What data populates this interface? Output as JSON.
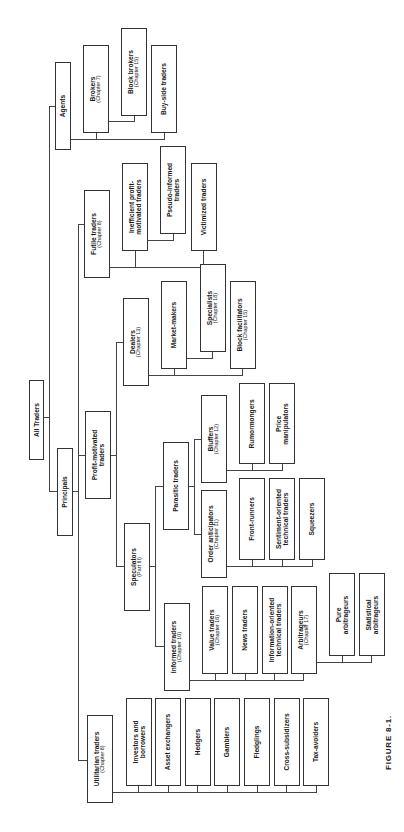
{
  "figure": {
    "caption": "FIGURE 8-1.",
    "title": "All Traders"
  },
  "nodes": {
    "all_traders": {
      "label": "All Traders",
      "sub": ""
    },
    "agents": {
      "label": "Agents",
      "sub": ""
    },
    "principals": {
      "label": "Principals",
      "sub": ""
    },
    "brokers": {
      "label": "Brokers",
      "sub": "(Chapter 7)"
    },
    "block_brokers": {
      "label": "Block brokers",
      "sub": "(Chapter 15)"
    },
    "buy_side_traders": {
      "label": "Buy-side traders",
      "sub": ""
    },
    "futile_traders": {
      "label": "Futile traders",
      "sub": "(Chapter 8)"
    },
    "inefficient": {
      "label": "Inefficient profit-",
      "label2": "motivated traders"
    },
    "pseudo_informed": {
      "label": "Pseudo-informed",
      "label2": "traders"
    },
    "victimized": {
      "label": "Victimized traders",
      "sub": ""
    },
    "profit_motivated": {
      "label": "Profit-motivated",
      "label2": "traders"
    },
    "dealers": {
      "label": "Dealers",
      "sub": "(Chapter 13)"
    },
    "market_makers": {
      "label": "Market-makers",
      "sub": ""
    },
    "specialists": {
      "label": "Specialists",
      "sub": "(Chapter 18)"
    },
    "block_facilitators": {
      "label": "Block facilitators",
      "sub": "(Chapter 15)"
    },
    "speculators": {
      "label": "Speculators",
      "sub": "(Part III)"
    },
    "parasitic": {
      "label": "Parasitic traders",
      "sub": ""
    },
    "bluffers": {
      "label": "Bluffers",
      "sub": "(Chapter 12)"
    },
    "order_anticipators": {
      "label": "Order anticipators",
      "sub": "(Chapter 11)"
    },
    "rumormongers": {
      "label": "Rumormongers",
      "sub": ""
    },
    "price_manipulators": {
      "label": "Price",
      "label2": "manipulators"
    },
    "front_runners": {
      "label": "Front-runners",
      "sub": ""
    },
    "sentiment": {
      "label": "Sentiment-oriented",
      "label2": "technical traders"
    },
    "squeezers": {
      "label": "Squeezers",
      "sub": ""
    },
    "informed": {
      "label": "Informed traders",
      "sub": "(Chapter 10)"
    },
    "value_traders": {
      "label": "Value traders",
      "sub": "(Chapter 16)"
    },
    "news_traders": {
      "label": "News traders",
      "sub": ""
    },
    "info_technical": {
      "label": "Information-oriented",
      "label2": "technical traders"
    },
    "arbitrageurs": {
      "label": "Arbitrageurs",
      "sub": "(Chapter 17)"
    },
    "pure_arb": {
      "label": "Pure",
      "label2": "arbitrageurs"
    },
    "stat_arb": {
      "label": "Statistical",
      "label2": "arbitrageurs"
    },
    "utilitarian": {
      "label": "Utilitarian traders",
      "sub": "(Chapter 8)"
    },
    "investors": {
      "label": "Investors and",
      "label2": "borrowers"
    },
    "asset_exchangers": {
      "label": "Asset exchangers",
      "sub": ""
    },
    "hedgers": {
      "label": "Hedgers",
      "sub": ""
    },
    "gamblers": {
      "label": "Gamblers",
      "sub": ""
    },
    "fledglings": {
      "label": "Fledglings",
      "sub": ""
    },
    "cross_subsidizers": {
      "label": "Cross-subsidizers",
      "sub": ""
    },
    "tax_avoiders": {
      "label": "Tax-avoiders",
      "sub": ""
    }
  }
}
